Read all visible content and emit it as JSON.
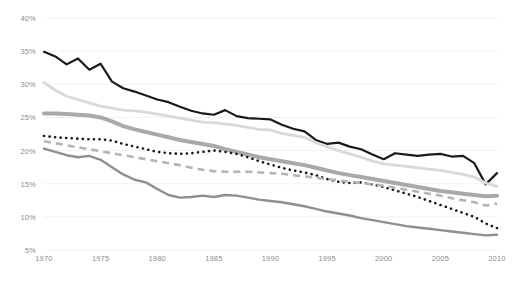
{
  "chart_data": {
    "type": "line",
    "title": "",
    "subtitle": "",
    "xlabel": "",
    "ylabel": "",
    "xlim": [
      1970,
      2010
    ],
    "ylim": [
      5,
      40
    ],
    "ytick_labels": [
      "40%",
      "35%",
      "30%",
      "25%",
      "20%",
      "15%",
      "10%",
      "5%"
    ],
    "ytick_values": [
      40,
      35,
      30,
      25,
      20,
      15,
      10,
      5
    ],
    "xtick_labels": [
      "1970",
      "1975",
      "1980",
      "1985",
      "1990",
      "1995",
      "2000",
      "2005",
      "2010"
    ],
    "xtick_values": [
      1970,
      1975,
      1980,
      1985,
      1990,
      1995,
      2000,
      2005,
      2010
    ],
    "grid": true,
    "grid_color": "#f1f1f1",
    "legend": "none",
    "legend_position": "none",
    "background": "#ffffff",
    "x": [
      1970,
      1971,
      1972,
      1973,
      1974,
      1975,
      1976,
      1977,
      1978,
      1979,
      1980,
      1981,
      1982,
      1983,
      1984,
      1985,
      1986,
      1987,
      1988,
      1989,
      1990,
      1991,
      1992,
      1993,
      1994,
      1995,
      1996,
      1997,
      1998,
      1999,
      2000,
      2001,
      2002,
      2003,
      2004,
      2005,
      2006,
      2007,
      2008,
      2009,
      2010
    ],
    "series": [
      {
        "name": "series-1-black-solid",
        "style": "solid",
        "color": "#1a1a1a",
        "width": 2.2,
        "values": [
          34.9,
          34.2,
          33.0,
          33.9,
          32.2,
          33.1,
          30.4,
          29.4,
          28.9,
          28.3,
          27.7,
          27.3,
          26.6,
          26.0,
          25.6,
          25.4,
          26.1,
          25.2,
          24.9,
          24.8,
          24.7,
          23.9,
          23.3,
          22.9,
          21.6,
          21.0,
          21.2,
          20.6,
          20.2,
          19.4,
          18.7,
          19.6,
          19.4,
          19.2,
          19.4,
          19.5,
          19.1,
          19.2,
          18.1,
          14.9,
          16.6
        ]
      },
      {
        "name": "series-2-light-gray-solid",
        "style": "solid",
        "color": "#d9d9d9",
        "width": 2.8,
        "values": [
          30.3,
          29.1,
          28.2,
          27.7,
          27.2,
          26.7,
          26.4,
          26.1,
          26.0,
          25.8,
          25.5,
          25.2,
          24.9,
          24.6,
          24.3,
          24.2,
          24.0,
          23.8,
          23.5,
          23.2,
          23.1,
          22.6,
          22.3,
          22.0,
          21.2,
          20.6,
          20.0,
          19.5,
          19.0,
          18.4,
          18.0,
          17.8,
          17.6,
          17.4,
          17.2,
          17.0,
          16.7,
          16.4,
          16.0,
          15.1,
          14.6
        ]
      },
      {
        "name": "series-3-gray-thick-solid",
        "style": "solid",
        "color": "#a9a9a9",
        "width": 4.0,
        "values": [
          25.6,
          25.6,
          25.5,
          25.4,
          25.3,
          25.0,
          24.4,
          23.7,
          23.2,
          22.8,
          22.4,
          22.0,
          21.6,
          21.3,
          21.0,
          20.7,
          20.2,
          19.8,
          19.4,
          19.0,
          18.7,
          18.4,
          18.1,
          17.8,
          17.4,
          17.0,
          16.6,
          16.3,
          16.0,
          15.7,
          15.4,
          15.1,
          14.8,
          14.5,
          14.2,
          13.9,
          13.7,
          13.5,
          13.3,
          13.1,
          13.2
        ]
      },
      {
        "name": "series-4-black-dotted",
        "style": "dotted",
        "color": "#1a1a1a",
        "width": 2.6,
        "values": [
          22.2,
          22.0,
          21.9,
          21.8,
          21.7,
          21.7,
          21.5,
          21.0,
          20.6,
          20.2,
          19.8,
          19.6,
          19.5,
          19.6,
          19.8,
          20.0,
          19.8,
          19.5,
          19.0,
          18.4,
          17.9,
          17.4,
          17.0,
          16.7,
          16.3,
          15.7,
          15.3,
          15.1,
          15.2,
          14.9,
          14.5,
          14.0,
          13.5,
          13.0,
          12.4,
          11.8,
          11.2,
          10.6,
          10.0,
          9.0,
          8.3
        ]
      },
      {
        "name": "series-5-gray-dashed",
        "style": "dashed",
        "color": "#b4b4b4",
        "width": 2.6,
        "values": [
          21.4,
          21.1,
          20.8,
          20.5,
          20.2,
          19.9,
          19.6,
          19.3,
          19.0,
          18.7,
          18.4,
          18.1,
          17.8,
          17.4,
          17.1,
          16.9,
          16.8,
          16.8,
          16.8,
          16.7,
          16.6,
          16.5,
          16.3,
          16.1,
          15.9,
          15.7,
          15.5,
          15.3,
          15.1,
          14.9,
          14.7,
          14.4,
          14.1,
          13.8,
          13.5,
          13.2,
          12.8,
          12.5,
          12.2,
          11.7,
          12.0
        ]
      },
      {
        "name": "series-6-gray-solid-lower",
        "style": "solid",
        "color": "#8f8f8f",
        "width": 2.4,
        "values": [
          20.3,
          19.8,
          19.3,
          19.0,
          19.2,
          18.6,
          17.5,
          16.4,
          15.6,
          15.2,
          14.2,
          13.3,
          12.9,
          13.0,
          13.2,
          13.0,
          13.3,
          13.2,
          12.9,
          12.6,
          12.4,
          12.2,
          11.9,
          11.6,
          11.2,
          10.8,
          10.5,
          10.2,
          9.8,
          9.5,
          9.2,
          8.9,
          8.6,
          8.4,
          8.2,
          8.0,
          7.8,
          7.6,
          7.4,
          7.2,
          7.3
        ]
      }
    ]
  }
}
